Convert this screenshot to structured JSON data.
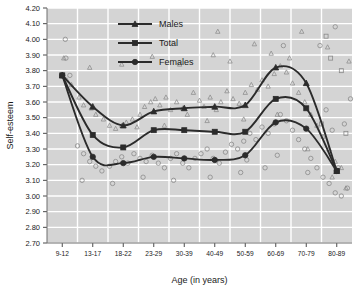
{
  "chart_data": {
    "type": "line",
    "title": "",
    "xlabel": "Age (in years)",
    "ylabel": "Self-esteem",
    "categories": [
      "9-12",
      "13-17",
      "18-22",
      "23-29",
      "30-39",
      "40-49",
      "50-59",
      "60-69",
      "70-79",
      "80-89"
    ],
    "ylim": [
      2.7,
      4.2
    ],
    "ytick_labels": [
      "2.70",
      "2.80",
      "2.90",
      "3.00",
      "3.10",
      "3.20",
      "3.30",
      "3.40",
      "3.50",
      "3.60",
      "3.70",
      "3.80",
      "3.90",
      "4.00",
      "4.10",
      "4.20"
    ],
    "ytick_values": [
      2.7,
      2.8,
      2.9,
      3.0,
      3.1,
      3.2,
      3.3,
      3.4,
      3.5,
      3.6,
      3.7,
      3.8,
      3.9,
      4.0,
      4.1,
      4.2
    ],
    "grid": true,
    "legend_position": "top-center",
    "series": [
      {
        "name": "Males",
        "marker": "triangle",
        "values": [
          3.77,
          3.57,
          3.45,
          3.54,
          3.56,
          3.57,
          3.58,
          3.82,
          3.72,
          3.16
        ]
      },
      {
        "name": "Total",
        "marker": "square",
        "values": [
          3.77,
          3.39,
          3.31,
          3.42,
          3.42,
          3.41,
          3.41,
          3.62,
          3.56,
          3.16
        ]
      },
      {
        "name": "Females",
        "marker": "circle",
        "values": [
          3.77,
          3.25,
          3.21,
          3.25,
          3.24,
          3.23,
          3.26,
          3.47,
          3.43,
          3.16
        ]
      }
    ],
    "scatter": {
      "males_triangles": [
        [
          0.15,
          3.74
        ],
        [
          0.3,
          3.71
        ],
        [
          0.55,
          3.63
        ],
        [
          0.7,
          3.58
        ],
        [
          0.95,
          3.56
        ],
        [
          1.1,
          3.52
        ],
        [
          1.35,
          3.49
        ],
        [
          1.55,
          3.45
        ],
        [
          1.75,
          3.43
        ],
        [
          1.95,
          3.45
        ],
        [
          2.1,
          3.47
        ],
        [
          2.3,
          3.49
        ],
        [
          2.55,
          3.52
        ],
        [
          2.7,
          3.57
        ],
        [
          2.9,
          3.6
        ],
        [
          3.05,
          3.62
        ],
        [
          3.2,
          3.58
        ],
        [
          3.4,
          3.63
        ],
        [
          3.55,
          3.55
        ],
        [
          3.75,
          3.6
        ],
        [
          3.95,
          3.56
        ],
        [
          4.1,
          3.52
        ],
        [
          4.3,
          3.66
        ],
        [
          4.5,
          3.61
        ],
        [
          4.65,
          3.57
        ],
        [
          4.85,
          3.63
        ],
        [
          5.05,
          3.55
        ],
        [
          5.2,
          3.6
        ],
        [
          5.4,
          3.67
        ],
        [
          5.6,
          3.62
        ],
        [
          5.8,
          3.59
        ],
        [
          6.0,
          3.66
        ],
        [
          6.2,
          3.71
        ],
        [
          6.4,
          3.68
        ],
        [
          6.55,
          3.74
        ],
        [
          6.75,
          3.7
        ],
        [
          6.95,
          3.78
        ],
        [
          7.15,
          3.83
        ],
        [
          7.35,
          3.79
        ],
        [
          7.55,
          3.72
        ],
        [
          7.75,
          3.66
        ],
        [
          7.95,
          3.6
        ],
        [
          8.15,
          3.52
        ],
        [
          8.35,
          3.45
        ],
        [
          8.55,
          3.38
        ],
        [
          8.75,
          3.3
        ],
        [
          8.95,
          3.22
        ],
        [
          9.15,
          3.18
        ],
        [
          2.45,
          3.44
        ],
        [
          3.35,
          3.45
        ],
        [
          4.75,
          3.48
        ],
        [
          5.95,
          3.49
        ],
        [
          7.05,
          3.52
        ],
        [
          8.05,
          3.3
        ],
        [
          8.85,
          3.12
        ],
        [
          9.3,
          3.05
        ],
        [
          6.85,
          3.91
        ],
        [
          7.45,
          3.88
        ],
        [
          5.5,
          3.86
        ],
        [
          4.95,
          3.9
        ],
        [
          3.85,
          3.84
        ],
        [
          2.95,
          3.89
        ],
        [
          1.95,
          3.84
        ],
        [
          0.9,
          3.82
        ],
        [
          0.05,
          3.88
        ],
        [
          6.3,
          3.97
        ],
        [
          5.1,
          4.05
        ],
        [
          7.85,
          4.05
        ],
        [
          8.7,
          3.95
        ],
        [
          9.4,
          3.86
        ]
      ],
      "females_circles": [
        [
          0.1,
          4.0
        ],
        [
          0.12,
          3.88
        ],
        [
          0.25,
          3.77
        ],
        [
          0.5,
          3.32
        ],
        [
          0.7,
          3.27
        ],
        [
          0.9,
          3.22
        ],
        [
          1.1,
          3.19
        ],
        [
          1.3,
          3.16
        ],
        [
          1.55,
          3.19
        ],
        [
          1.75,
          3.22
        ],
        [
          1.95,
          3.25
        ],
        [
          2.15,
          3.21
        ],
        [
          2.35,
          3.27
        ],
        [
          2.55,
          3.24
        ],
        [
          2.75,
          3.22
        ],
        [
          2.95,
          3.26
        ],
        [
          3.15,
          3.21
        ],
        [
          3.35,
          3.18
        ],
        [
          3.55,
          3.24
        ],
        [
          3.75,
          3.27
        ],
        [
          3.95,
          3.21
        ],
        [
          4.15,
          3.18
        ],
        [
          4.35,
          3.24
        ],
        [
          4.55,
          3.27
        ],
        [
          4.75,
          3.3
        ],
        [
          4.95,
          3.24
        ],
        [
          5.15,
          3.21
        ],
        [
          5.35,
          3.28
        ],
        [
          5.55,
          3.33
        ],
        [
          5.75,
          3.3
        ],
        [
          5.95,
          3.35
        ],
        [
          6.15,
          3.4
        ],
        [
          6.35,
          3.36
        ],
        [
          6.55,
          3.44
        ],
        [
          6.75,
          3.4
        ],
        [
          6.95,
          3.46
        ],
        [
          7.15,
          3.52
        ],
        [
          7.35,
          3.48
        ],
        [
          7.55,
          3.42
        ],
        [
          7.75,
          3.36
        ],
        [
          7.95,
          3.3
        ],
        [
          8.15,
          3.24
        ],
        [
          8.35,
          3.18
        ],
        [
          8.55,
          3.12
        ],
        [
          8.75,
          3.08
        ],
        [
          8.95,
          3.02
        ],
        [
          9.15,
          3.0
        ],
        [
          9.35,
          3.05
        ],
        [
          6.05,
          3.23
        ],
        [
          7.05,
          3.26
        ],
        [
          8.05,
          3.15
        ],
        [
          9.05,
          3.18
        ],
        [
          8.85,
          3.42
        ],
        [
          9.25,
          3.46
        ],
        [
          8.65,
          3.55
        ],
        [
          9.45,
          3.62
        ],
        [
          6.65,
          3.18
        ],
        [
          5.85,
          3.15
        ],
        [
          4.85,
          3.12
        ],
        [
          3.65,
          3.1
        ],
        [
          2.65,
          3.12
        ],
        [
          1.65,
          3.08
        ],
        [
          0.65,
          3.1
        ],
        [
          8.45,
          3.96
        ],
        [
          8.95,
          4.08
        ],
        [
          7.25,
          3.96
        ]
      ],
      "total_squares": [
        [
          8.65,
          4.02
        ],
        [
          8.8,
          3.88
        ],
        [
          9.15,
          3.8
        ],
        [
          8.5,
          3.46
        ],
        [
          9.3,
          3.4
        ]
      ]
    }
  },
  "legend": {
    "items": [
      {
        "label": "Males"
      },
      {
        "label": "Total"
      },
      {
        "label": "Females"
      }
    ]
  }
}
